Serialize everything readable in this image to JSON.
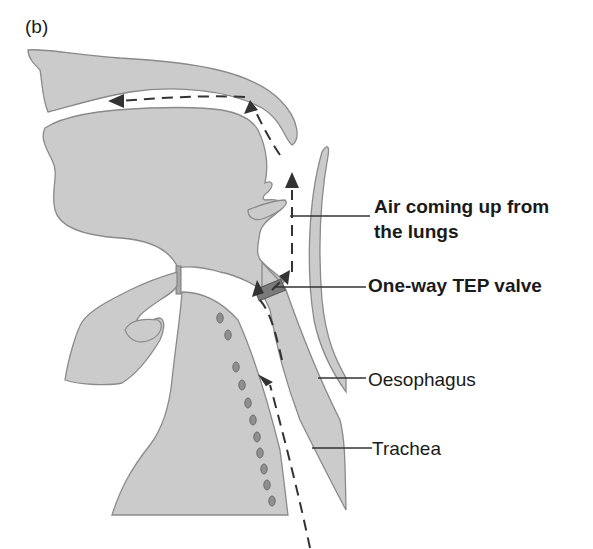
{
  "figure": {
    "panel_label": "(b)",
    "labels": {
      "air_line1": "Air coming up from",
      "air_line2": "the lungs",
      "valve": "One-way TEP valve",
      "oesophagus": "Oesophagus",
      "trachea": "Trachea"
    },
    "colors": {
      "tissue_fill": "#cbcbcb",
      "tissue_outline": "#8a8a8a",
      "valve_fill": "#7a7a7a",
      "arrow": "#333333",
      "text": "#1a1a1a"
    }
  }
}
